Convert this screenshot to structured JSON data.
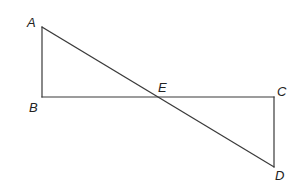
{
  "diagram": {
    "type": "geometry",
    "points": {
      "A": {
        "label": "A",
        "x": 42,
        "y": 27,
        "label_x": 27,
        "label_y": 27
      },
      "B": {
        "label": "B",
        "x": 42,
        "y": 97,
        "label_x": 29,
        "label_y": 112
      },
      "E": {
        "label": "E",
        "x": 160,
        "y": 97,
        "label_x": 158,
        "label_y": 92
      },
      "C": {
        "label": "C",
        "x": 274,
        "y": 97,
        "label_x": 277,
        "label_y": 96
      },
      "D": {
        "label": "D",
        "x": 274,
        "y": 167,
        "label_x": 275,
        "label_y": 180
      }
    },
    "segments": [
      {
        "from": "A",
        "to": "B"
      },
      {
        "from": "B",
        "to": "C"
      },
      {
        "from": "C",
        "to": "D"
      },
      {
        "from": "A",
        "to": "D"
      }
    ],
    "stroke_color": "#3a3a3a",
    "label_color": "#222222"
  }
}
